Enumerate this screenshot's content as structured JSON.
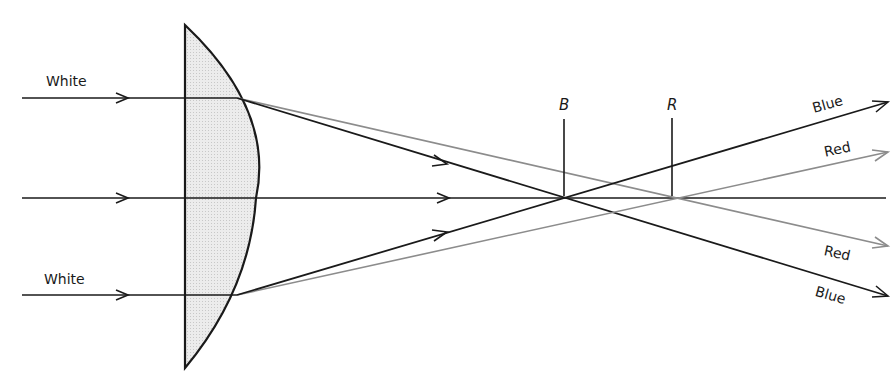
{
  "diagram": {
    "type": "chromatic-aberration-lens",
    "colors": {
      "black_ray": "#1a1a1a",
      "gray_ray": "#8c8c8c",
      "lens_fill": "#e6e6e6",
      "lens_stroke": "#1a1a1a"
    },
    "labels": {
      "incoming_top": "White",
      "incoming_bottom": "White",
      "focus_blue": "B",
      "focus_red": "R",
      "out_top_blue": "Blue",
      "out_top_red": "Red",
      "out_bottom_red": "Red",
      "out_bottom_blue": "Blue"
    }
  }
}
